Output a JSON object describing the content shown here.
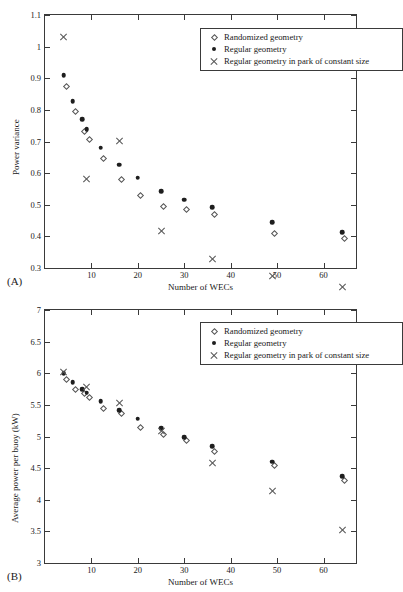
{
  "figure": {
    "panel_a_tag": "(A)",
    "panel_b_tag": "(B)"
  },
  "legend": {
    "items": [
      {
        "marker": "diamond-open-marker",
        "label": "Randomized geometry"
      },
      {
        "marker": "circle-filled-marker",
        "label": "Regular geometry"
      },
      {
        "marker": "cross-marker",
        "label": "Regular geometry in park of constant size"
      }
    ]
  },
  "chart_data": [
    {
      "type": "scatter",
      "id": "power-variance",
      "panel": "(A)",
      "title": "",
      "xlabel": "Number of WECs",
      "ylabel": "Power variance",
      "xlim": [
        0,
        67
      ],
      "ylim": [
        0.3,
        1.1
      ],
      "xticks": [
        10,
        20,
        30,
        40,
        50,
        60
      ],
      "xticklabels": [
        "10",
        "20",
        "30",
        "40",
        "50",
        "60"
      ],
      "yticks": [
        0.3,
        0.4,
        0.5,
        0.6,
        0.7,
        0.8,
        0.9,
        1.0,
        1.1
      ],
      "yticklabels": [
        "0.3",
        "0.4",
        "0.5",
        "0.6",
        "0.7",
        "0.8",
        "0.9",
        "1",
        "1.1"
      ],
      "grid": false,
      "legend_position": "upper right",
      "series": [
        {
          "name": "Randomized geometry",
          "marker": "diamond-open-marker",
          "x": [
            4,
            6,
            8,
            9,
            12,
            16,
            20,
            25,
            30,
            36,
            49,
            64
          ],
          "y": [
            0.881,
            0.803,
            0.741,
            0.714,
            0.654,
            0.588,
            0.538,
            0.503,
            0.494,
            0.478,
            0.417,
            0.4
          ]
        },
        {
          "name": "Regular geometry",
          "marker": "circle-filled-marker",
          "x": [
            4,
            6,
            8,
            9,
            12,
            16,
            20,
            25,
            30,
            36,
            49,
            64
          ],
          "y": [
            0.91,
            0.827,
            0.77,
            0.739,
            0.681,
            0.627,
            0.586,
            0.542,
            0.516,
            0.492,
            0.444,
            0.414
          ]
        },
        {
          "name": "Regular geometry in park of constant size",
          "marker": "cross-marker",
          "x": [
            4,
            9,
            16,
            25,
            36,
            49,
            64
          ],
          "y": [
            1.03,
            0.609,
            0.758,
            0.503,
            0.441,
            0.417,
            0.41
          ]
        }
      ]
    },
    {
      "type": "scatter",
      "id": "average-power-per-buoy",
      "panel": "(B)",
      "title": "",
      "xlabel": "Number of WECs",
      "ylabel": "Average power per buoy (kW)",
      "xlim": [
        0,
        67
      ],
      "ylim": [
        3,
        7
      ],
      "xticks": [
        10,
        20,
        30,
        40,
        50,
        60
      ],
      "xticklabels": [
        "10",
        "20",
        "30",
        "40",
        "50",
        "60"
      ],
      "yticks": [
        3,
        3.5,
        4,
        4.5,
        5,
        5.5,
        6,
        6.5,
        7
      ],
      "yticklabels": [
        "3",
        "3.5",
        "4",
        "4.5",
        "5",
        "5.5",
        "6",
        "6.5",
        "7"
      ],
      "grid": false,
      "legend_position": "upper right",
      "series": [
        {
          "name": "Randomized geometry",
          "marker": "diamond-open-marker",
          "x": [
            4,
            6,
            8,
            9,
            12,
            16,
            20,
            25,
            30,
            36,
            49,
            64
          ],
          "y": [
            5.94,
            5.79,
            5.72,
            5.66,
            5.49,
            5.4,
            5.18,
            5.07,
            4.97,
            4.81,
            4.58,
            4.35
          ]
        },
        {
          "name": "Regular geometry",
          "marker": "circle-filled-marker",
          "x": [
            4,
            6,
            8,
            9,
            12,
            16,
            20,
            25,
            30,
            36,
            49,
            64
          ],
          "y": [
            6.0,
            5.86,
            5.75,
            5.69,
            5.56,
            5.42,
            5.28,
            5.13,
            4.99,
            4.85,
            4.6,
            4.37
          ]
        },
        {
          "name": "Regular geometry in park of constant size",
          "marker": "cross-marker",
          "x": [
            4,
            9,
            16,
            25,
            36,
            49,
            64
          ],
          "y": [
            6.02,
            5.93,
            5.82,
            5.51,
            5.15,
            4.85,
            4.37
          ]
        }
      ]
    }
  ]
}
